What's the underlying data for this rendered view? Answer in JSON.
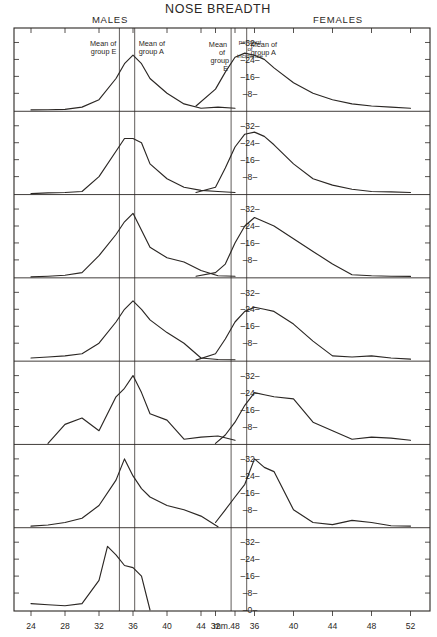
{
  "header": {
    "title": "NOSE BREADTH",
    "left_sex_label": "MALES",
    "right_sex_label": "FEMALES"
  },
  "annotations": {
    "left_mean_e": "Mean of\ngroup E",
    "left_mean_e_l1": "Mean of",
    "left_mean_e_l2": "group E",
    "left_mean_a_l1": "Mean of",
    "left_mean_a_l2": "group A",
    "right_mean_e_l1": "Mean",
    "right_mean_e_l2": "of",
    "right_mean_e_l3": "group",
    "right_mean_e_l4": "E",
    "right_mean_a_l1": "Mean of",
    "right_mean_a_l2": "group A",
    "axis_caption_l1": "per cent",
    "axis_caption_l2": "of",
    "axis_caption_l3": "incidence"
  },
  "axes": {
    "unit_label": "mm.",
    "x_ticks_left": [
      "24",
      "28",
      "32",
      "36",
      "40",
      "44",
      "48"
    ],
    "x_ticks_right": [
      "32",
      "36",
      "40",
      "44",
      "48",
      "52"
    ],
    "y_tick_labels": [
      "32",
      "24",
      "16",
      "8"
    ],
    "y_tick_labels_last_panel": [
      "32",
      "24",
      "16",
      "8",
      "0"
    ],
    "y_dash": "–"
  },
  "panels": [
    {
      "id": "total",
      "label": "Total Yucatecans"
    },
    {
      "id": "a",
      "label": "Group A"
    },
    {
      "id": "b",
      "label": "Group B"
    },
    {
      "id": "c",
      "label": "Group C"
    },
    {
      "id": "d",
      "label": "Group D"
    },
    {
      "id": "e",
      "label": "Group E"
    },
    {
      "id": "spanish",
      "label": "Spanish (Barras)"
    }
  ],
  "chart_data": {
    "type": "line",
    "title": "NOSE BREADTH",
    "xlabel": "mm.",
    "ylabel": "per cent of incidence",
    "ylim": [
      0,
      36
    ],
    "grid": false,
    "legend_position": "none",
    "panel_layout": "7 stacked panels, males left half, females right half",
    "x_axis_left": {
      "min": 22,
      "max": 50,
      "ticks": [
        24,
        28,
        32,
        36,
        40,
        44,
        48
      ]
    },
    "x_axis_right": {
      "min": 30,
      "max": 54,
      "ticks": [
        32,
        36,
        40,
        44,
        48,
        52
      ]
    },
    "y_axis": {
      "min": 0,
      "max": 36,
      "ticks": [
        0,
        8,
        16,
        24,
        32
      ],
      "labeled_ticks": [
        8,
        16,
        24,
        32
      ]
    },
    "mean_lines": {
      "male_group_E": 34.4,
      "male_group_A": 36.2,
      "female_group_E": 33.6,
      "female_group_A": 35.2
    },
    "panels": [
      {
        "name": "Total Yucatecans",
        "series": [
          {
            "name": "males",
            "x": [
              24,
              26,
              28,
              30,
              32,
              34,
              35,
              36,
              37,
              38,
              40,
              42,
              44,
              46,
              48
            ],
            "values": [
              0.2,
              0.3,
              0.4,
              1.5,
              5,
              15,
              22,
              26,
              22,
              15,
              8,
              3,
              1,
              1.5,
              1
            ]
          },
          {
            "name": "females",
            "x": [
              30,
              32,
              33,
              34,
              35,
              36,
              37,
              38,
              40,
              42,
              44,
              46,
              48,
              50,
              52
            ],
            "values": [
              2,
              10,
              18,
              25,
              27,
              26,
              24,
              20,
              13,
              8,
              5,
              3,
              2,
              1.5,
              1
            ]
          }
        ]
      },
      {
        "name": "Group A",
        "series": [
          {
            "name": "males",
            "x": [
              24,
              26,
              28,
              30,
              32,
              34,
              35,
              36,
              37,
              38,
              40,
              42,
              44,
              46,
              48
            ],
            "values": [
              0,
              0.3,
              0.5,
              1,
              8,
              20,
              26,
              26,
              24,
              14,
              7,
              3,
              1.5,
              1,
              0.5
            ]
          },
          {
            "name": "females",
            "x": [
              30,
              32,
              33,
              34,
              35,
              36,
              37,
              38,
              40,
              42,
              44,
              46,
              48,
              50,
              52
            ],
            "values": [
              0.5,
              3,
              12,
              22,
              28,
              29,
              27,
              23,
              14,
              7,
              4,
              2,
              1,
              0.8,
              0.5
            ]
          }
        ]
      },
      {
        "name": "Group B",
        "series": [
          {
            "name": "males",
            "x": [
              24,
              26,
              28,
              30,
              32,
              34,
              35,
              36,
              37,
              38,
              40,
              42,
              44,
              46,
              48
            ],
            "values": [
              0,
              0.3,
              0.8,
              2,
              10,
              20,
              26,
              30,
              22,
              14,
              9,
              7,
              3,
              0.5,
              0.3
            ]
          },
          {
            "name": "females",
            "x": [
              30,
              32,
              33,
              34,
              35,
              36,
              37,
              38,
              40,
              42,
              44,
              46,
              48,
              50,
              52
            ],
            "values": [
              0.3,
              2,
              6,
              16,
              24,
              28,
              26,
              24,
              18,
              12,
              6,
              1,
              0.5,
              0.3,
              0.2
            ]
          }
        ]
      },
      {
        "name": "Group C",
        "series": [
          {
            "name": "males",
            "x": [
              24,
              26,
              28,
              30,
              32,
              34,
              35,
              36,
              37,
              38,
              40,
              42,
              44,
              46,
              48
            ],
            "values": [
              1,
              1.5,
              2,
              3,
              8,
              18,
              24,
              28,
              24,
              19,
              13,
              8,
              1,
              0.3,
              0.2
            ]
          },
          {
            "name": "females",
            "x": [
              30,
              32,
              33,
              34,
              35,
              36,
              37,
              38,
              40,
              42,
              44,
              46,
              48,
              50,
              52
            ],
            "values": [
              0,
              3,
              10,
              18,
              23,
              25,
              24,
              23,
              17,
              9,
              2,
              1.5,
              2,
              1,
              0.5
            ]
          }
        ]
      },
      {
        "name": "Group D",
        "series": [
          {
            "name": "males",
            "x": [
              26,
              28,
              30,
              32,
              34,
              35,
              36,
              37,
              38,
              40,
              42,
              44,
              46,
              48
            ],
            "values": [
              0,
              9,
              12,
              6,
              22,
              26,
              32,
              24,
              14,
              11,
              2,
              3,
              3.5,
              1.5
            ]
          },
          {
            "name": "females",
            "x": [
              32,
              33,
              34,
              35,
              36,
              37,
              38,
              40,
              42,
              44,
              46,
              48,
              50,
              52
            ],
            "values": [
              0,
              4,
              10,
              18,
              24,
              23,
              22,
              21,
              10,
              6,
              2,
              3,
              2.5,
              1.5
            ]
          }
        ],
        "dashed_segments": [
          "males: 26-30 mm leading tail",
          "males: 44-48 mm trailing tail",
          "females: 46-52 mm trailing tail"
        ]
      },
      {
        "name": "Group E",
        "series": [
          {
            "name": "males",
            "x": [
              24,
              26,
              28,
              30,
              32,
              34,
              35,
              36,
              37,
              38,
              40,
              42,
              44,
              46
            ],
            "values": [
              0.3,
              0.8,
              2,
              4,
              10,
              22,
              32,
              24,
              18,
              14,
              10,
              8,
              5,
              0
            ]
          },
          {
            "name": "females",
            "x": [
              32,
              33,
              34,
              35,
              36,
              37,
              38,
              40,
              42,
              44,
              46,
              48,
              50,
              52
            ],
            "values": [
              2,
              8,
              14,
              20,
              32,
              28,
              26,
              8,
              2,
              1,
              3,
              2,
              0.5,
              0.3
            ]
          }
        ],
        "dashed_segments": [
          "males: 42-46 mm trailing tail"
        ]
      },
      {
        "name": "Spanish (Barras)",
        "series": [
          {
            "name": "males",
            "x": [
              24,
              26,
              28,
              30,
              32,
              33,
              34,
              35,
              36,
              37,
              38
            ],
            "values": [
              3,
              2.5,
              2,
              3,
              14,
              30,
              26,
              21,
              20,
              16,
              0
            ]
          }
        ],
        "note": "Males only; no female curve plotted in this panel."
      }
    ]
  }
}
